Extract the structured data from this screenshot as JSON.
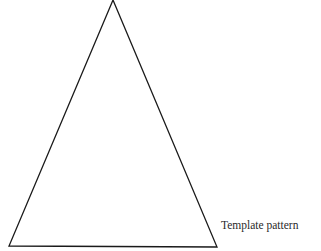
{
  "diagram": {
    "shape": "triangle",
    "vertices": {
      "apex": [
        113,
        0
      ],
      "bottom_left": [
        9,
        246
      ],
      "bottom_right": [
        217,
        247
      ]
    },
    "stroke_color": "#1a1a1a",
    "fill_color": "#ffffff",
    "label": "Template pattern"
  }
}
